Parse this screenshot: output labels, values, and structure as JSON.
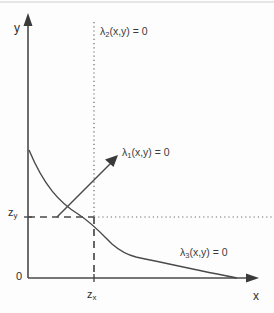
{
  "figure": {
    "type": "diagram",
    "background_color": "#fdfdfd",
    "line_color": "#4a4a4a",
    "text_color": "#2e2e2e"
  },
  "axes": {
    "y_label": "y",
    "x_label": "x",
    "origin_label": "0"
  },
  "ticks": {
    "y": {
      "base": "z",
      "subscript": "y"
    },
    "x": {
      "base": "z",
      "subscript": "x"
    }
  },
  "curves": [
    {
      "id": "lambda1",
      "base": "λ",
      "subscript": "1",
      "suffix": "(x,y) = 0",
      "style": "solid-line-with-arrow",
      "description": "straight ray rising to the upper right from the z_y level"
    },
    {
      "id": "lambda2",
      "base": "λ",
      "subscript": "2",
      "suffix": "(x,y) = 0",
      "style": "dotted-vertical-line",
      "description": "vertical dotted line at x = z_x"
    },
    {
      "id": "lambda3",
      "base": "λ",
      "subscript": "3",
      "suffix": "(x,y) = 0",
      "style": "solid-decreasing-curve",
      "description": "convex decreasing curve from the y-axis down to the x-axis"
    }
  ],
  "guides": {
    "horizontal_dashed": "dashed segment from y-axis to the intersection point",
    "horizontal_dotted": "dotted segment continuing right of the intersection point",
    "vertical_dashed": "dashed segment from the intersection point down to the x-axis"
  }
}
